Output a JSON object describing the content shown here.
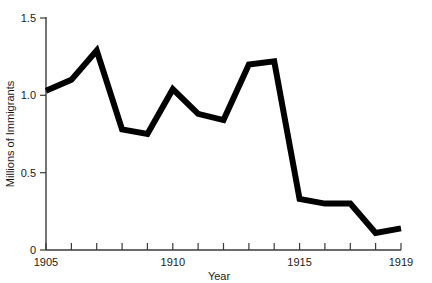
{
  "chart_data": {
    "type": "line",
    "title": "",
    "xlabel": "Year",
    "ylabel": "Millions of Immigrants",
    "xlim": [
      1905,
      1919
    ],
    "ylim": [
      0,
      1.5
    ],
    "grid": false,
    "legend": null,
    "x": [
      1905,
      1906,
      1907,
      1908,
      1909,
      1910,
      1911,
      1912,
      1913,
      1914,
      1915,
      1916,
      1917,
      1918,
      1919
    ],
    "values": [
      1.03,
      1.1,
      1.29,
      0.78,
      0.75,
      1.04,
      0.88,
      0.84,
      1.2,
      1.22,
      0.33,
      0.3,
      0.3,
      0.11,
      0.14
    ],
    "series": [
      {
        "name": "Immigrants",
        "color": "#000000",
        "values": [
          1.03,
          1.1,
          1.29,
          0.78,
          0.75,
          1.04,
          0.88,
          0.84,
          1.2,
          1.22,
          0.33,
          0.3,
          0.3,
          0.11,
          0.14
        ]
      }
    ],
    "xticks": [
      1905,
      1906,
      1907,
      1908,
      1909,
      1910,
      1911,
      1912,
      1913,
      1914,
      1915,
      1916,
      1917,
      1918,
      1919
    ],
    "xticklabels": [
      "1905",
      "",
      "",
      "",
      "",
      "1910",
      "",
      "",
      "",
      "",
      "1915",
      "",
      "",
      "",
      "1919"
    ],
    "yticks": [
      0,
      0.5,
      1.0,
      1.5
    ],
    "yticklabels": [
      "0",
      "0.5",
      "1.0",
      "1.5"
    ]
  },
  "axes": {
    "x_title": "Year",
    "y_title": "Millions of Immigrants",
    "x_labels": {
      "start": "1905",
      "mid1": "1910",
      "mid2": "1915",
      "end": "1919"
    },
    "y_labels": {
      "zero": "0",
      "half": "0.5",
      "one": "1.0",
      "one_half": "1.5"
    }
  },
  "colors": {
    "line": "#000000",
    "axis": "#3a3a3a",
    "text": "#1a1a1a",
    "background": "#ffffff"
  }
}
